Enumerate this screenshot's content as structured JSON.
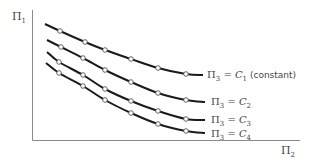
{
  "chart_data": {
    "type": "line",
    "title": "",
    "xlabel": "Π₂",
    "ylabel": "Π₁",
    "grid": false,
    "legend": "inline labels at right end of each curve",
    "axis_ticks": "none",
    "series": [
      {
        "name": "Π₃ = C₁ (constant)",
        "label_main": "Π",
        "label_sub": "3",
        "label_eq": " = C",
        "label_csub": "1",
        "label_suffix": " (constant)",
        "points": [
          [
            45,
            24
          ],
          [
            60,
            31
          ],
          [
            85,
            42
          ],
          [
            105,
            50
          ],
          [
            131,
            59
          ],
          [
            158,
            68
          ],
          [
            186,
            74
          ],
          [
            203,
            75
          ]
        ],
        "markers": [
          [
            60,
            31
          ],
          [
            85,
            42
          ],
          [
            105,
            50
          ],
          [
            131,
            59
          ],
          [
            158,
            68
          ],
          [
            186,
            74
          ]
        ]
      },
      {
        "name": "Π₃ = C₂",
        "label_main": "Π",
        "label_sub": "3",
        "label_eq": " = C",
        "label_csub": "2",
        "label_suffix": "",
        "points": [
          [
            47,
            40
          ],
          [
            61,
            47
          ],
          [
            83,
            58
          ],
          [
            105,
            70
          ],
          [
            131,
            82
          ],
          [
            158,
            93
          ],
          [
            186,
            100
          ],
          [
            205,
            102
          ]
        ],
        "markers": [
          [
            61,
            47
          ],
          [
            83,
            58
          ],
          [
            105,
            70
          ],
          [
            131,
            82
          ],
          [
            158,
            93
          ],
          [
            186,
            100
          ]
        ]
      },
      {
        "name": "Π₃ = C₃",
        "label_main": "Π",
        "label_sub": "3",
        "label_eq": " = C",
        "label_csub": "3",
        "label_suffix": "",
        "points": [
          [
            47,
            52
          ],
          [
            59,
            62
          ],
          [
            83,
            75
          ],
          [
            105,
            89
          ],
          [
            131,
            101
          ],
          [
            158,
            111
          ],
          [
            186,
            119
          ],
          [
            205,
            120
          ]
        ],
        "markers": [
          [
            59,
            62
          ],
          [
            83,
            75
          ],
          [
            105,
            89
          ],
          [
            131,
            101
          ],
          [
            158,
            111
          ],
          [
            186,
            119
          ]
        ]
      },
      {
        "name": "Π₃ = C₄",
        "label_main": "Π",
        "label_sub": "3",
        "label_eq": " = C",
        "label_csub": "4",
        "label_suffix": "",
        "points": [
          [
            46,
            63
          ],
          [
            59,
            73
          ],
          [
            83,
            86
          ],
          [
            105,
            100
          ],
          [
            131,
            113
          ],
          [
            158,
            124
          ],
          [
            186,
            131
          ],
          [
            205,
            133
          ]
        ],
        "markers": [
          [
            59,
            73
          ],
          [
            83,
            86
          ],
          [
            105,
            100
          ],
          [
            131,
            113
          ],
          [
            158,
            124
          ],
          [
            186,
            131
          ]
        ]
      }
    ],
    "label_positions": [
      [
        207,
        78
      ],
      [
        211,
        105
      ],
      [
        211,
        123
      ],
      [
        211,
        137
      ]
    ]
  },
  "axes": {
    "y_label_main": "Π",
    "y_label_sub": "1",
    "x_label_main": "Π",
    "x_label_sub": "2"
  },
  "colors": {
    "curve": "#1a1a1a",
    "axis": "#8a8a8a",
    "marker_fill": "#ffffff",
    "text": "#444444"
  }
}
